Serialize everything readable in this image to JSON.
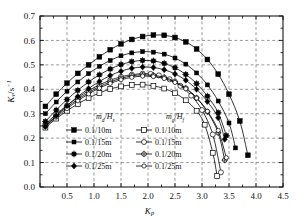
{
  "chart_data": {
    "type": "line",
    "title": "",
    "xlabel": "Kp",
    "ylabel": "Kv/s-1",
    "xlabel_parts": {
      "base": "K",
      "sub": "p"
    },
    "ylabel_parts": {
      "base": "K",
      "sub": "v",
      "unit_base": "/s",
      "unit_sup": "-1"
    },
    "xlim": [
      0.0,
      4.5
    ],
    "ylim": [
      0.0,
      0.7
    ],
    "xticks": [
      0.0,
      0.5,
      1.0,
      1.5,
      2.0,
      2.5,
      3.0,
      3.5,
      4.0,
      4.5
    ],
    "xticklabels": [
      "",
      "0.5",
      "1.0",
      "1.5",
      "2.0",
      "2.5",
      "3.0",
      "3.5",
      "4.0",
      "4.5"
    ],
    "yticks": [
      0.0,
      0.1,
      0.2,
      0.3,
      0.4,
      0.5,
      0.6,
      0.7
    ],
    "yticklabels": [
      "0.0",
      "0.1",
      "0.2",
      "0.3",
      "0.4",
      "0.5",
      "0.6",
      "0.7"
    ],
    "grid": true,
    "grid_style": "dashed",
    "minor_xticks": [
      0.25,
      0.75,
      1.25,
      1.75,
      2.25,
      2.75,
      3.25,
      3.75,
      4.25
    ],
    "legend_position": "inside-lower-left",
    "series": [
      {
        "name": "0.1/10m",
        "group": "filled",
        "marker": "square-filled",
        "x": [
          0.1,
          0.3,
          0.5,
          0.7,
          0.9,
          1.1,
          1.3,
          1.5,
          1.7,
          1.9,
          2.1,
          2.3,
          2.5,
          2.7,
          2.9,
          3.1,
          3.3,
          3.5,
          3.7,
          3.85
        ],
        "y": [
          0.33,
          0.38,
          0.425,
          0.465,
          0.5,
          0.533,
          0.562,
          0.586,
          0.604,
          0.616,
          0.622,
          0.621,
          0.612,
          0.594,
          0.565,
          0.522,
          0.462,
          0.38,
          0.27,
          0.13
        ]
      },
      {
        "name": "0.1/15m",
        "group": "filled",
        "marker": "square-filled-small",
        "x": [
          0.1,
          0.3,
          0.5,
          0.7,
          0.9,
          1.1,
          1.3,
          1.5,
          1.7,
          1.9,
          2.1,
          2.3,
          2.5,
          2.7,
          2.9,
          3.1,
          3.3,
          3.5,
          3.62
        ],
        "y": [
          0.3,
          0.348,
          0.392,
          0.43,
          0.464,
          0.494,
          0.518,
          0.537,
          0.549,
          0.554,
          0.552,
          0.544,
          0.528,
          0.503,
          0.467,
          0.418,
          0.352,
          0.262,
          0.16
        ]
      },
      {
        "name": "0.1/20m",
        "group": "filled",
        "marker": "cross-filled",
        "x": [
          0.1,
          0.3,
          0.5,
          0.7,
          0.9,
          1.1,
          1.3,
          1.5,
          1.7,
          1.9,
          2.1,
          2.3,
          2.5,
          2.7,
          2.9,
          3.1,
          3.3,
          3.45
        ],
        "y": [
          0.268,
          0.315,
          0.358,
          0.396,
          0.43,
          0.459,
          0.483,
          0.501,
          0.513,
          0.518,
          0.516,
          0.506,
          0.488,
          0.461,
          0.423,
          0.372,
          0.304,
          0.21
        ]
      },
      {
        "name": "0.1/25m",
        "group": "filled",
        "marker": "diamond-filled",
        "x": [
          0.1,
          0.3,
          0.5,
          0.7,
          0.9,
          1.1,
          1.3,
          1.5,
          1.7,
          1.9,
          2.1,
          2.3,
          2.5,
          2.7,
          2.9,
          3.1,
          3.3,
          3.42
        ],
        "y": [
          0.248,
          0.292,
          0.333,
          0.37,
          0.403,
          0.432,
          0.456,
          0.474,
          0.486,
          0.491,
          0.489,
          0.48,
          0.463,
          0.437,
          0.4,
          0.35,
          0.283,
          0.195
        ]
      },
      {
        "name": "0.1/10m",
        "group": "hollow",
        "marker": "square-hollow",
        "x": [
          0.1,
          0.3,
          0.5,
          0.7,
          0.9,
          1.1,
          1.3,
          1.5,
          1.7,
          1.9,
          2.1,
          2.3,
          2.5,
          2.7,
          2.9,
          3.05,
          3.2,
          3.28
        ],
        "y": [
          0.243,
          0.28,
          0.312,
          0.34,
          0.364,
          0.385,
          0.401,
          0.412,
          0.418,
          0.419,
          0.414,
          0.403,
          0.384,
          0.355,
          0.312,
          0.255,
          0.14,
          0.045
        ]
      },
      {
        "name": "0.1/15m",
        "group": "hollow",
        "marker": "circle-hollow",
        "x": [
          0.1,
          0.3,
          0.5,
          0.7,
          0.9,
          1.1,
          1.3,
          1.5,
          1.7,
          1.9,
          2.05,
          2.2,
          2.4,
          2.6,
          2.8,
          3.0,
          3.2,
          3.35
        ],
        "y": [
          0.258,
          0.298,
          0.334,
          0.366,
          0.394,
          0.418,
          0.437,
          0.451,
          0.46,
          0.464,
          0.463,
          0.457,
          0.441,
          0.414,
          0.374,
          0.315,
          0.215,
          0.06
        ]
      },
      {
        "name": "0.1/20m",
        "group": "hollow",
        "marker": "star-hollow",
        "x": [
          0.1,
          0.3,
          0.5,
          0.7,
          0.9,
          1.1,
          1.3,
          1.5,
          1.7,
          1.9,
          2.1,
          2.3,
          2.5,
          2.7,
          2.9,
          3.1,
          3.3,
          3.42
        ],
        "y": [
          0.252,
          0.291,
          0.327,
          0.359,
          0.387,
          0.411,
          0.43,
          0.445,
          0.455,
          0.459,
          0.457,
          0.449,
          0.432,
          0.405,
          0.365,
          0.308,
          0.222,
          0.11
        ]
      },
      {
        "name": "0.1/25m",
        "group": "hollow",
        "marker": "circle-hollow-small",
        "x": [
          0.1,
          0.3,
          0.5,
          0.7,
          0.9,
          1.1,
          1.3,
          1.5,
          1.7,
          1.9,
          2.1,
          2.3,
          2.5,
          2.7,
          2.9,
          3.1,
          3.3,
          3.45
        ],
        "y": [
          0.248,
          0.286,
          0.321,
          0.353,
          0.381,
          0.405,
          0.424,
          0.439,
          0.449,
          0.454,
          0.452,
          0.444,
          0.428,
          0.402,
          0.364,
          0.31,
          0.232,
          0.12
        ]
      }
    ],
    "legend": {
      "left_header": "md/Hs",
      "left_header_parts": {
        "m": "m",
        "m_sub": "d",
        "slash": "/H",
        "h_sub": "s"
      },
      "right_header": "mg/Hf",
      "right_header_parts": {
        "m": "m",
        "m_sub": "g",
        "slash": "/H",
        "h_sub": "f"
      },
      "left_items": [
        {
          "label": "0.1/10m",
          "marker": "square-filled"
        },
        {
          "label": "0.1/15m",
          "marker": "square-filled-small"
        },
        {
          "label": "0.1/20m",
          "marker": "cross-filled"
        },
        {
          "label": "0.1/25m",
          "marker": "diamond-filled"
        }
      ],
      "right_items": [
        {
          "label": "0.1/10m",
          "marker": "square-hollow"
        },
        {
          "label": "0.1/15m",
          "marker": "circle-hollow"
        },
        {
          "label": "0.1/20m",
          "marker": "star-hollow"
        },
        {
          "label": "0.1/25m",
          "marker": "circle-hollow-small"
        }
      ]
    },
    "colors": {
      "line": "#000000",
      "grid": "#555555",
      "axis": "#000000",
      "background": "#ffffff",
      "marker_fill": "#000000",
      "marker_hollow_fill": "#ffffff"
    }
  }
}
